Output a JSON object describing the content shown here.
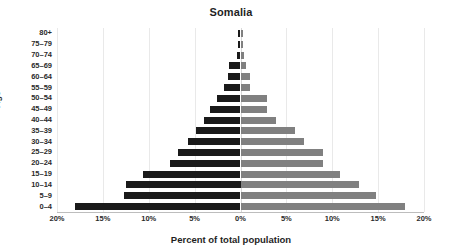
{
  "chart_data": {
    "type": "bar",
    "subtype": "population-pyramid",
    "title": "Somalia",
    "xlabel": "Percent of total population",
    "ylabel": "Age",
    "grid": true,
    "legend": null,
    "orientation": "horizontal",
    "xlim": [
      -20,
      20
    ],
    "xticks": [
      -20,
      -15,
      -10,
      -5,
      0,
      5,
      10,
      15,
      20
    ],
    "xtick_labels": [
      "20%",
      "15%",
      "10%",
      "5%",
      "0%",
      "5%",
      "10%",
      "15%",
      "20%"
    ],
    "categories": [
      "80+",
      "75–79",
      "70–74",
      "65–69",
      "60–64",
      "55–59",
      "50–54",
      "45–49",
      "40–44",
      "35–39",
      "30–34",
      "25–29",
      "20–24",
      "15–19",
      "10–14",
      "5–9",
      "0–4"
    ],
    "series": [
      {
        "name": "Male",
        "side": "left",
        "color": "#1a1a1a",
        "values": [
          0.3,
          0.3,
          0.4,
          1.3,
          1.4,
          1.8,
          2.6,
          3.3,
          4.0,
          4.8,
          5.7,
          6.8,
          7.7,
          10.6,
          12.5,
          12.7,
          18.0
        ]
      },
      {
        "name": "Female",
        "side": "right",
        "color": "#808080",
        "values": [
          0.3,
          0.3,
          0.4,
          0.6,
          1.0,
          1.0,
          2.9,
          2.9,
          3.9,
          5.9,
          6.9,
          9.0,
          9.0,
          10.8,
          12.9,
          14.8,
          17.9
        ]
      }
    ]
  },
  "colors": {
    "male_bar": "#1a1a1a",
    "female_bar": "#808080",
    "gridline": "#e9e9e9",
    "axis": "#bdbdbd",
    "text": "#2b2b2b",
    "background": "#ffffff"
  }
}
